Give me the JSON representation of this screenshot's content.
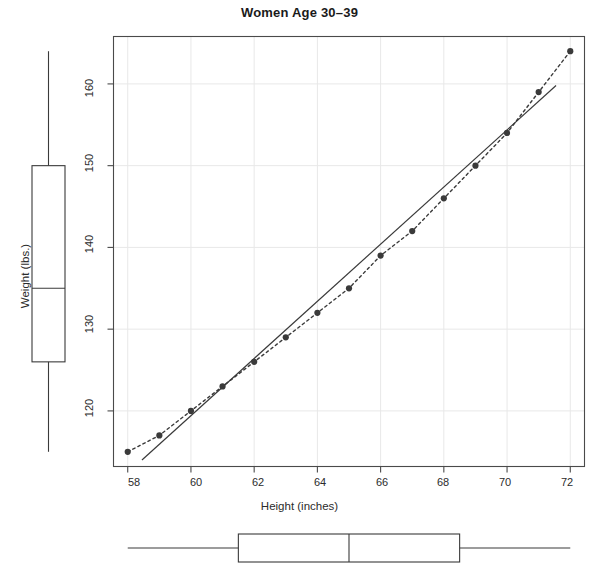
{
  "chart_data": {
    "type": "scatter",
    "title": "Women Age 30–39",
    "xlabel": "Height (inches)",
    "ylabel": "Weight (lbs.)",
    "x": [
      58,
      59,
      60,
      61,
      62,
      63,
      64,
      65,
      66,
      67,
      68,
      69,
      70,
      71,
      72
    ],
    "y": [
      115,
      117,
      120,
      123,
      126,
      129,
      132,
      135,
      139,
      142,
      146,
      150,
      154,
      159,
      164
    ],
    "series": [
      {
        "name": "observations",
        "style": "points",
        "marker": "filled-circle",
        "color": "#3a3a3a",
        "values": [
          115,
          117,
          120,
          123,
          126,
          129,
          132,
          135,
          139,
          142,
          146,
          150,
          154,
          159,
          164
        ]
      },
      {
        "name": "connected-observations",
        "style": "dashed-line",
        "color": "#3a3a3a",
        "values": [
          115,
          117,
          120,
          123,
          126,
          129,
          132,
          135,
          139,
          142,
          146,
          150,
          154,
          159,
          164
        ]
      },
      {
        "name": "least-squares-fit",
        "style": "solid-line",
        "color": "#3a3a3a",
        "endpoints": [
          {
            "x": 58.45,
            "y": 114.0
          },
          {
            "x": 71.55,
            "y": 159.8
          }
        ]
      }
    ],
    "xlim": [
      57.55,
      72.45
    ],
    "ylim": [
      113.2,
      165.8
    ],
    "xticks": [
      58,
      60,
      62,
      64,
      66,
      68,
      70,
      72
    ],
    "yticks": [
      120,
      130,
      140,
      150,
      160
    ],
    "grid": true,
    "grid_color": "#e8e8e8",
    "legend": "none",
    "marginal_boxplots": {
      "y_boxplot": {
        "orientation": "vertical",
        "position": "left-margin",
        "min": 115,
        "q1": 126,
        "median": 135,
        "q3": 150,
        "max": 164
      },
      "x_boxplot": {
        "orientation": "horizontal",
        "position": "bottom-margin",
        "min": 58,
        "q1": 61.5,
        "median": 65,
        "q3": 68.5,
        "max": 72
      }
    }
  },
  "colors": {
    "ink": "#3a3a3a",
    "grid": "#e6e6e6",
    "text": "#2b2b2b"
  }
}
